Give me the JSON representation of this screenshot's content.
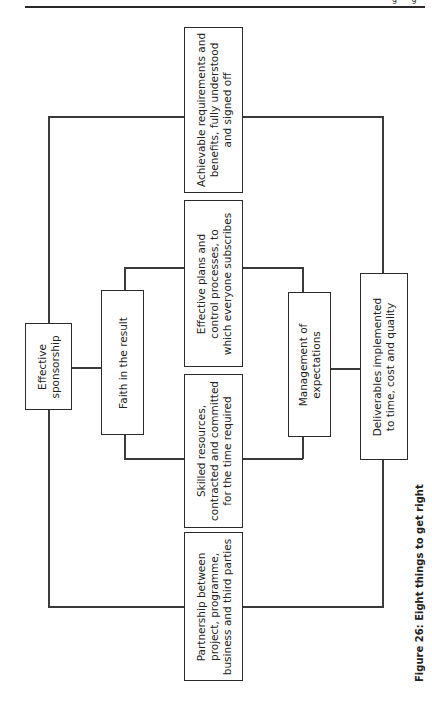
{
  "page": {
    "orientation": "rotated 90° counter-clockwise (landscape figure on portrait page)",
    "header_glyphs": "g g"
  },
  "diagram": {
    "title": "Eight things to get right",
    "nodes": {
      "sponsorship": "Effective\nsponsorship",
      "faith": "Faith in the result",
      "achievable": "Achievable requirements and\nbenefits, fully understood\nand signed off",
      "plans": "Effective plans and\ncontrol processes, to\nwhich everyone subscribes",
      "skilled": "Skilled resources,\ncontracted and committed\nfor the time required",
      "partnership": "Partnership between\nproject, programme,\nbusiness and third parties",
      "expectations": "Management of\nexpectations",
      "deliverables": "Deliverables implemented\nto time, cost and quality"
    },
    "edges": [
      [
        "sponsorship",
        "achievable"
      ],
      [
        "sponsorship",
        "partnership"
      ],
      [
        "sponsorship",
        "faith"
      ],
      [
        "faith",
        "plans"
      ],
      [
        "faith",
        "skilled"
      ],
      [
        "plans",
        "expectations"
      ],
      [
        "skilled",
        "expectations"
      ],
      [
        "expectations",
        "deliverables"
      ],
      [
        "achievable",
        "deliverables"
      ],
      [
        "partnership",
        "deliverables"
      ]
    ]
  },
  "caption": "Figure 26: Eight things to get right"
}
